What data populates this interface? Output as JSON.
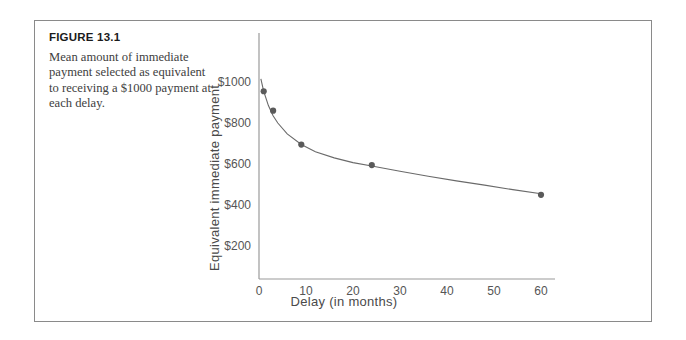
{
  "figure": {
    "number_label": "FIGURE 13.1",
    "caption": "Mean amount of immediate payment selected as equivalent to receiving a $1000 payment at each delay."
  },
  "chart_data": {
    "type": "scatter",
    "title": "",
    "xlabel": "Delay (in months)",
    "ylabel": "Equivalent immediate payment",
    "xlim": [
      0,
      63
    ],
    "ylim": [
      0,
      1100
    ],
    "grid": false,
    "legend": "none",
    "x_ticks": [
      "0",
      "10",
      "20",
      "30",
      "40",
      "50",
      "60"
    ],
    "x_tick_values": [
      0,
      10,
      20,
      30,
      40,
      50,
      60
    ],
    "y_ticks": [
      "$200",
      "$400",
      "$600",
      "$800",
      "$1000"
    ],
    "y_tick_values": [
      200,
      400,
      600,
      800,
      1000
    ],
    "x": [
      1,
      3,
      9,
      24,
      60
    ],
    "values": [
      950,
      855,
      690,
      590,
      445
    ],
    "points": [
      {
        "x": 1,
        "y": 950
      },
      {
        "x": 3,
        "y": 855
      },
      {
        "x": 9,
        "y": 690
      },
      {
        "x": 24,
        "y": 590
      },
      {
        "x": 60,
        "y": 445
      }
    ],
    "fit_curve": {
      "description": "hyperbolic discounting fit",
      "x": [
        0.4,
        1,
        2,
        3,
        4,
        6,
        9,
        12,
        16,
        20,
        24,
        30,
        36,
        42,
        48,
        54,
        60
      ],
      "y": [
        1010,
        950,
        880,
        830,
        795,
        742,
        690,
        655,
        625,
        602,
        585,
        560,
        535,
        513,
        492,
        470,
        450
      ]
    },
    "marker_color": "#5a5a5a",
    "line_color": "#6a6a6a",
    "axis_color": "#9a9a9a"
  }
}
